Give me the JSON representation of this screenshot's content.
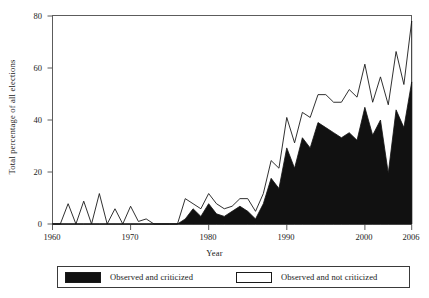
{
  "chart_data": {
    "type": "area",
    "title": "",
    "subtitle": "",
    "xlabel": "Year",
    "ylabel": "Total percentage of all elections",
    "xlim": [
      1960,
      2006
    ],
    "ylim": [
      0,
      82
    ],
    "xticks": [
      1960,
      1970,
      1980,
      1990,
      2000,
      2006
    ],
    "yticks": [
      0,
      20,
      40,
      60,
      80
    ],
    "xticklabels": [
      "1960",
      "1970",
      "1980",
      "1990",
      "2000",
      "2006"
    ],
    "yticklabels": [
      "0",
      "20",
      "40",
      "60",
      "80"
    ],
    "grid": false,
    "legend_position": "below-axes",
    "legend": [
      {
        "label": "Observed and criticized",
        "color": "#111111",
        "style": "filled"
      },
      {
        "label": "Observed and not criticized",
        "color": "#ffffff",
        "style": "empty"
      }
    ],
    "x": [
      1960,
      1961,
      1962,
      1963,
      1964,
      1965,
      1966,
      1967,
      1968,
      1969,
      1970,
      1971,
      1972,
      1973,
      1974,
      1975,
      1976,
      1977,
      1978,
      1979,
      1980,
      1981,
      1982,
      1983,
      1984,
      1985,
      1986,
      1987,
      1988,
      1989,
      1990,
      1991,
      1992,
      1993,
      1994,
      1995,
      1996,
      1997,
      1998,
      1999,
      2000,
      2001,
      2002,
      2003,
      2004,
      2005,
      2006
    ],
    "series": [
      {
        "name": "Observed and criticized",
        "note": "lower boundary of stacked area; value = pct observed and criticized",
        "values": [
          0,
          0,
          0,
          0,
          0,
          0,
          0,
          0,
          0,
          0,
          0,
          0,
          0,
          0,
          0,
          0,
          0,
          2,
          6,
          3,
          8,
          4,
          3,
          5,
          7,
          5,
          2,
          8,
          18,
          14,
          30,
          22,
          34,
          30,
          40,
          38,
          36,
          34,
          36,
          33,
          46,
          35,
          41,
          20,
          45,
          38,
          56
        ]
      },
      {
        "name": "Observed and not criticized",
        "note": "upper boundary of stacked area; total = observed (criticized + not criticized)",
        "values": [
          0,
          0,
          8,
          0,
          9,
          0,
          12,
          0,
          6,
          0,
          7,
          1,
          2,
          0,
          0,
          0,
          0,
          10,
          8,
          6,
          12,
          8,
          6,
          7,
          10,
          10,
          5,
          12,
          25,
          22,
          42,
          32,
          44,
          42,
          51,
          51,
          48,
          48,
          53,
          50,
          63,
          48,
          58,
          47,
          68,
          55,
          80
        ]
      }
    ]
  },
  "axis_titles": {
    "x": "Year",
    "y": "Total percentage of all elections"
  }
}
